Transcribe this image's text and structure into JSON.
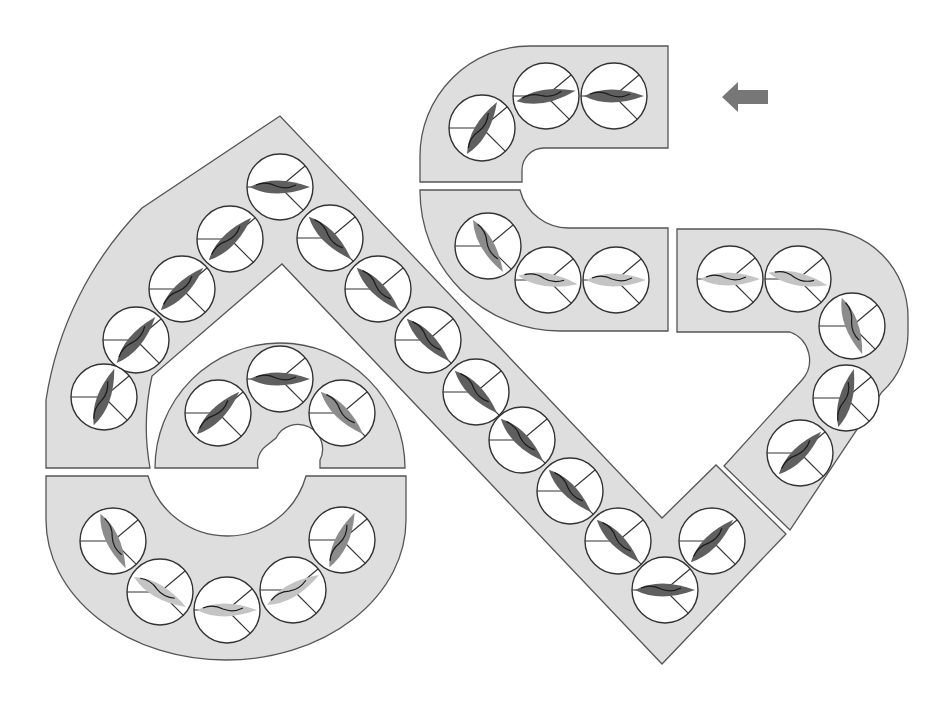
{
  "colors": {
    "background": "#ffffff",
    "track_fill": "#dedede",
    "track_stroke": "#555555",
    "boat_dark": "#5f5f5f",
    "boat_mid": "#8c8c8c",
    "boat_light": "#c4c4c4",
    "arrow": "#777777"
  },
  "direction_arrow": {
    "icon": "arrow-left-icon",
    "x": 745,
    "y": 97
  },
  "segments": [
    {
      "name": "top-hook",
      "cells": [
        {
          "x": 482,
          "y": 128,
          "angle": -60,
          "shade": "dark"
        },
        {
          "x": 546,
          "y": 96,
          "angle": -10,
          "shade": "dark"
        },
        {
          "x": 614,
          "y": 96,
          "angle": 0,
          "shade": "dark"
        }
      ]
    },
    {
      "name": "middle-hook",
      "cells": [
        {
          "x": 488,
          "y": 246,
          "angle": 60,
          "shade": "mid"
        },
        {
          "x": 548,
          "y": 280,
          "angle": 8,
          "shade": "light"
        },
        {
          "x": 616,
          "y": 280,
          "angle": 0,
          "shade": "light"
        }
      ]
    },
    {
      "name": "right-curve",
      "cells": [
        {
          "x": 730,
          "y": 279,
          "angle": 0,
          "shade": "light"
        },
        {
          "x": 798,
          "y": 279,
          "angle": 12,
          "shade": "light"
        },
        {
          "x": 852,
          "y": 326,
          "angle": 70,
          "shade": "mid"
        },
        {
          "x": 846,
          "y": 398,
          "angle": -75,
          "shade": "dark"
        },
        {
          "x": 800,
          "y": 453,
          "angle": -45,
          "shade": "dark"
        }
      ]
    },
    {
      "name": "apex-left-diagonal",
      "cells": [
        {
          "x": 280,
          "y": 187,
          "angle": 0,
          "shade": "dark"
        },
        {
          "x": 230,
          "y": 239,
          "angle": -45,
          "shade": "dark"
        },
        {
          "x": 182,
          "y": 289,
          "angle": -45,
          "shade": "dark"
        },
        {
          "x": 136,
          "y": 340,
          "angle": -50,
          "shade": "dark"
        },
        {
          "x": 104,
          "y": 397,
          "angle": -70,
          "shade": "dark"
        }
      ]
    },
    {
      "name": "long-diagonal",
      "cells": [
        {
          "x": 330,
          "y": 238,
          "angle": 45,
          "shade": "dark"
        },
        {
          "x": 378,
          "y": 289,
          "angle": 45,
          "shade": "dark"
        },
        {
          "x": 428,
          "y": 340,
          "angle": 45,
          "shade": "dark"
        },
        {
          "x": 476,
          "y": 392,
          "angle": 45,
          "shade": "dark"
        },
        {
          "x": 522,
          "y": 440,
          "angle": 45,
          "shade": "dark"
        },
        {
          "x": 570,
          "y": 491,
          "angle": 45,
          "shade": "dark"
        },
        {
          "x": 618,
          "y": 541,
          "angle": 45,
          "shade": "dark"
        },
        {
          "x": 665,
          "y": 590,
          "angle": 0,
          "shade": "dark"
        },
        {
          "x": 712,
          "y": 541,
          "angle": -45,
          "shade": "dark"
        }
      ]
    },
    {
      "name": "inner-arch",
      "cells": [
        {
          "x": 218,
          "y": 413,
          "angle": -45,
          "shade": "dark"
        },
        {
          "x": 280,
          "y": 379,
          "angle": 0,
          "shade": "dark"
        },
        {
          "x": 342,
          "y": 413,
          "angle": 45,
          "shade": "mid"
        }
      ]
    },
    {
      "name": "bottom-u",
      "cells": [
        {
          "x": 113,
          "y": 541,
          "angle": 65,
          "shade": "mid"
        },
        {
          "x": 160,
          "y": 592,
          "angle": 30,
          "shade": "light"
        },
        {
          "x": 227,
          "y": 610,
          "angle": 0,
          "shade": "light"
        },
        {
          "x": 293,
          "y": 590,
          "angle": -30,
          "shade": "light"
        },
        {
          "x": 342,
          "y": 540,
          "angle": -65,
          "shade": "mid"
        }
      ]
    }
  ]
}
